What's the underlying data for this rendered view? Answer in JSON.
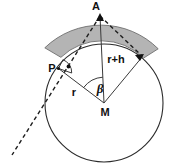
{
  "figure": {
    "background_color": "#ffffff",
    "line_color": "#2b2b2b",
    "band_fill_color": "#b4b4b4",
    "band_stroke_color": "#6e6e6e",
    "dashed_color": "#1d1d1d",
    "labels": {
      "apex": "A",
      "tangent_point": "P",
      "center": "M",
      "radius": "r",
      "height_from_center": "r+h",
      "angle": "β"
    },
    "geometry": {
      "center_x": 104,
      "center_y": 103,
      "radius": 59,
      "apex_x": 100,
      "apex_y": 14,
      "tangent_point_x": 58,
      "tangent_point_y": 68,
      "right_arrow_x": 142,
      "right_arrow_y": 56,
      "band_outer_radius": 81,
      "band_start_angle_deg": 137,
      "band_end_angle_deg": 48
    }
  }
}
